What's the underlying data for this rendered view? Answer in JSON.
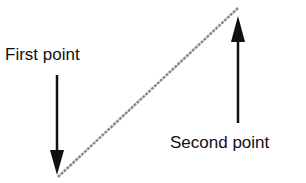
{
  "diagram": {
    "labels": {
      "first": "First point",
      "second": "Second point"
    },
    "line": {
      "x1": 58,
      "y1": 177,
      "x2": 238,
      "y2": 8,
      "color": "#8a8a8a"
    },
    "arrow_color": "#111111"
  }
}
